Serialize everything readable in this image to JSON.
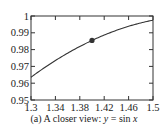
{
  "chart_data": {
    "type": "line",
    "title": "",
    "caption": "(a) A closer view: y = sin x",
    "caption_prefix": "(a) A closer view: ",
    "caption_eq_lhs": "y",
    "caption_eq_mid": " = sin ",
    "caption_eq_rhs": "x",
    "xlabel": "",
    "ylabel": "",
    "xlim": [
      1.3,
      1.5
    ],
    "ylim": [
      0.95,
      1.0
    ],
    "x_ticks": [
      1.3,
      1.34,
      1.38,
      1.42,
      1.46,
      1.5
    ],
    "x_tick_labels": [
      "1.3",
      "1.34",
      "1.38",
      "1.42",
      "1.46",
      "1.5"
    ],
    "y_ticks": [
      0.95,
      0.96,
      0.97,
      0.98,
      0.99,
      1.0
    ],
    "y_tick_labels": [
      "0.95",
      "0.96",
      "0.97",
      "0.98",
      "0.99",
      "1"
    ],
    "grid": false,
    "series": [
      {
        "name": "y = sin x",
        "function": "sin",
        "x": [
          1.3,
          1.32,
          1.34,
          1.36,
          1.38,
          1.4,
          1.42,
          1.44,
          1.46,
          1.48,
          1.5
        ],
        "values": [
          0.9636,
          0.9687,
          0.9735,
          0.9779,
          0.9819,
          0.9854,
          0.9887,
          0.9915,
          0.9939,
          0.9959,
          0.9975
        ],
        "color": "#333333"
      }
    ],
    "marked_point": {
      "x": 1.4,
      "y": 0.9854,
      "color": "#333333"
    }
  }
}
